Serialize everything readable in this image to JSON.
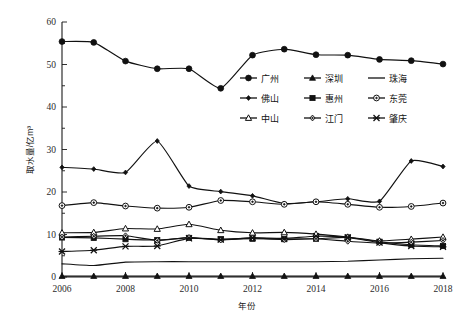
{
  "chart_data": {
    "type": "line",
    "title": "",
    "xlabel": "年份",
    "ylabel": "取水量/亿m³",
    "x": [
      2006,
      2007,
      2008,
      2009,
      2010,
      2011,
      2012,
      2013,
      2014,
      2015,
      2016,
      2017,
      2018
    ],
    "xlim": [
      2006,
      2018
    ],
    "ylim": [
      0,
      60
    ],
    "y_ticks": [
      0,
      10,
      20,
      30,
      40,
      50,
      60
    ],
    "y_minor_ticks": [
      5,
      15,
      25,
      35,
      45,
      55
    ],
    "x_ticks": [
      2006,
      2008,
      2010,
      2012,
      2014,
      2016,
      2018
    ],
    "x_minor_ticks": [
      2007,
      2009,
      2011,
      2013,
      2015,
      2017
    ],
    "grid": false,
    "legend_position": "upper-right-inside",
    "series": [
      {
        "name": "广州",
        "marker": "filled-circle",
        "values": [
          55.4,
          55.2,
          50.8,
          49.0,
          49.0,
          44.4,
          52.2,
          53.6,
          52.3,
          52.2,
          51.2,
          50.9,
          50.1
        ]
      },
      {
        "name": "深圳",
        "marker": "filled-triangle",
        "values": [
          0.2,
          0.2,
          0.2,
          0.2,
          0.2,
          0.2,
          0.2,
          0.2,
          0.2,
          0.2,
          0.2,
          0.2,
          0.2
        ]
      },
      {
        "name": "珠海",
        "marker": "none",
        "values": [
          3.1,
          2.7,
          3.5,
          3.6,
          3.6,
          3.6,
          3.6,
          3.6,
          3.6,
          3.7,
          4.0,
          4.3,
          4.4
        ]
      },
      {
        "name": "佛山",
        "marker": "small-filled-diamond",
        "values": [
          25.8,
          25.4,
          24.6,
          32.0,
          21.4,
          20.1,
          19.1,
          17.3,
          17.7,
          18.4,
          17.8,
          27.3,
          26.0
        ]
      },
      {
        "name": "惠州",
        "marker": "filled-square",
        "values": [
          9.3,
          9.2,
          8.9,
          8.7,
          9.2,
          8.9,
          9.0,
          8.9,
          9.0,
          9.3,
          8.3,
          7.6,
          7.3
        ]
      },
      {
        "name": "东莞",
        "marker": "open-circle",
        "values": [
          16.8,
          17.5,
          16.7,
          16.2,
          16.4,
          18.0,
          17.7,
          17.1,
          17.7,
          17.1,
          16.4,
          16.6,
          17.4
        ]
      },
      {
        "name": "中山",
        "marker": "open-triangle",
        "values": [
          10.4,
          10.5,
          11.4,
          11.3,
          12.4,
          11.0,
          10.4,
          10.5,
          10.1,
          9.4,
          8.5,
          8.9,
          9.4
        ]
      },
      {
        "name": "江门",
        "marker": "open-diamond",
        "values": [
          9.4,
          9.6,
          9.7,
          8.6,
          9.3,
          8.7,
          9.2,
          8.8,
          9.0,
          8.4,
          8.0,
          8.2,
          8.6
        ]
      },
      {
        "name": "肇庆",
        "marker": "x-cross",
        "values": [
          6.0,
          6.3,
          7.2,
          7.3,
          9.1,
          8.8,
          9.2,
          9.1,
          9.6,
          9.3,
          8.1,
          7.3,
          7.1
        ]
      }
    ]
  },
  "legend": {
    "entries": [
      {
        "label": "广州",
        "marker": "filled-circle"
      },
      {
        "label": "深圳",
        "marker": "filled-triangle"
      },
      {
        "label": "珠海",
        "marker": "none"
      },
      {
        "label": "佛山",
        "marker": "small-filled-diamond"
      },
      {
        "label": "惠州",
        "marker": "filled-square"
      },
      {
        "label": "东莞",
        "marker": "open-circle"
      },
      {
        "label": "中山",
        "marker": "open-triangle"
      },
      {
        "label": "江门",
        "marker": "open-diamond"
      },
      {
        "label": "肇庆",
        "marker": "x-cross"
      }
    ]
  },
  "axes": {
    "y_title": "取水量/亿m³",
    "x_title": "年份",
    "y_tick_labels": [
      "0",
      "10",
      "20",
      "30",
      "40",
      "50",
      "60"
    ],
    "x_tick_labels": [
      "2006",
      "2008",
      "2010",
      "2012",
      "2014",
      "2016",
      "2018"
    ]
  },
  "colors": {
    "ink": "#111111",
    "axis": "#1a1a1a",
    "background": "#ffffff"
  }
}
